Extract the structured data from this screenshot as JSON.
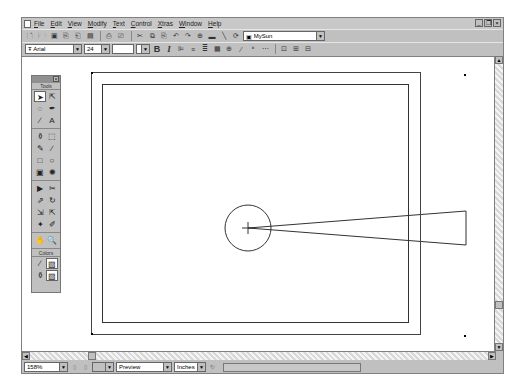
{
  "menubar": {
    "items": [
      "File",
      "Edit",
      "View",
      "Modify",
      "Text",
      "Control",
      "Xtras",
      "Window",
      "Help"
    ],
    "window_controls": [
      "minimize",
      "restore",
      "close"
    ]
  },
  "toolbar1": {
    "icons": [
      "new-icon",
      "open-icon",
      "save-icon",
      "import-icon",
      "export-icon",
      "publish-icon",
      "print-icon",
      "print-preview-icon",
      "cut-icon",
      "copy-icon",
      "paste-icon",
      "undo-icon",
      "redo-icon",
      "snap-icon",
      "smooth-icon",
      "straighten-icon",
      "rotate-icon"
    ],
    "scene_select": "MySun"
  },
  "toolbar2": {
    "font": "Arial",
    "font_size": "24",
    "bold": "B",
    "italic": "I",
    "align_icons": [
      "align-left-icon",
      "align-center-icon",
      "align-right-icon",
      "justify-icon"
    ]
  },
  "tools_panel": {
    "title": "Tools",
    "colors_label": "Colors",
    "tools": [
      {
        "name": "arrow",
        "glyph": "➤",
        "active": true
      },
      {
        "name": "subselect",
        "glyph": "⇱"
      },
      {
        "name": "lasso",
        "glyph": "◌"
      },
      {
        "name": "pen",
        "glyph": "✒"
      },
      {
        "name": "line",
        "glyph": "∕"
      },
      {
        "name": "text",
        "glyph": "A"
      },
      {
        "name": "ink-bottle",
        "glyph": "⚱"
      },
      {
        "name": "free-transform",
        "glyph": "⬚"
      },
      {
        "name": "pencil",
        "glyph": "✎"
      },
      {
        "name": "brush",
        "glyph": "∕"
      },
      {
        "name": "rectangle",
        "glyph": "□"
      },
      {
        "name": "oval",
        "glyph": "○"
      },
      {
        "name": "fill",
        "glyph": "▣"
      },
      {
        "name": "gradient",
        "glyph": "✺"
      },
      {
        "name": "eraser",
        "glyph": "▶"
      },
      {
        "name": "eyedropper",
        "glyph": "✂"
      },
      {
        "name": "transform",
        "glyph": "⇗"
      },
      {
        "name": "rotate",
        "glyph": "↻"
      },
      {
        "name": "scale",
        "glyph": "⇲"
      },
      {
        "name": "skew",
        "glyph": "⇱"
      },
      {
        "name": "distort",
        "glyph": "✦"
      },
      {
        "name": "envelope",
        "glyph": "✐"
      },
      {
        "name": "hand",
        "glyph": "✋"
      },
      {
        "name": "zoom",
        "glyph": "🔍"
      }
    ],
    "color_tools": [
      {
        "name": "stroke-color",
        "glyph": "∕"
      },
      {
        "name": "stroke-swatch",
        "glyph": "▨"
      },
      {
        "name": "fill-color",
        "glyph": "⚱"
      },
      {
        "name": "fill-swatch",
        "glyph": "▨"
      }
    ]
  },
  "statusbar": {
    "zoom": "158%",
    "mode": "Preview",
    "units": "Inches"
  },
  "colors": {
    "chrome": "#c0c0c0",
    "canvas": "#ffffff",
    "stroke": "#222222"
  }
}
